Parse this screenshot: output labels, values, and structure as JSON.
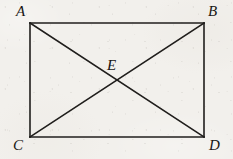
{
  "figure": {
    "background_color": "#f2f0ec",
    "line_color": "#201e1c",
    "label_color": "#181614",
    "line_width": 1.6,
    "canvas": {
      "width": 233,
      "height": 159
    },
    "shape": {
      "type": "rectangle-with-diagonals",
      "rect": {
        "left": 30,
        "top": 23,
        "right": 204,
        "bottom": 137,
        "width": 174,
        "height": 114
      },
      "vertices": [
        {
          "id": "A",
          "label": "A",
          "x": 30,
          "y": 23,
          "label_x": 16,
          "label_y": 4,
          "position": "above-left"
        },
        {
          "id": "B",
          "label": "B",
          "x": 204,
          "y": 23,
          "label_x": 208,
          "label_y": 4,
          "position": "above-right"
        },
        {
          "id": "C",
          "label": "C",
          "x": 30,
          "y": 137,
          "label_x": 13,
          "label_y": 138,
          "position": "below-left"
        },
        {
          "id": "D",
          "label": "D",
          "x": 204,
          "y": 137,
          "label_x": 209,
          "label_y": 138,
          "position": "below-right"
        }
      ],
      "intersection": {
        "id": "E",
        "label": "E",
        "x": 117,
        "y": 80,
        "label_x": 107,
        "label_y": 58
      },
      "edges": [
        {
          "id": "AB",
          "from": "A",
          "to": "B",
          "kind": "side"
        },
        {
          "id": "BD",
          "from": "B",
          "to": "D",
          "kind": "side"
        },
        {
          "id": "DC",
          "from": "D",
          "to": "C",
          "kind": "side"
        },
        {
          "id": "CA",
          "from": "C",
          "to": "A",
          "kind": "side"
        },
        {
          "id": "AD",
          "from": "A",
          "to": "D",
          "kind": "diagonal"
        },
        {
          "id": "BC",
          "from": "B",
          "to": "C",
          "kind": "diagonal"
        }
      ]
    }
  }
}
